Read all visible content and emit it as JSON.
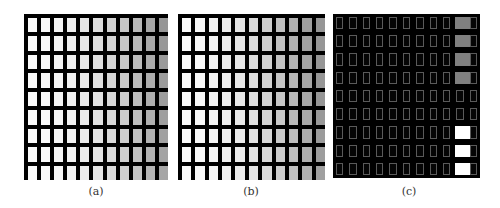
{
  "figure": {
    "panels": [
      {
        "id": "a",
        "label": "(a)",
        "style": "light",
        "x": 24,
        "y": 14,
        "w": 144,
        "h": 166
      },
      {
        "id": "b",
        "label": "(b)",
        "style": "light",
        "x": 178,
        "y": 14,
        "w": 147,
        "h": 166
      },
      {
        "id": "c",
        "label": "(c)",
        "style": "dark",
        "x": 333,
        "y": 14,
        "w": 147,
        "h": 164
      }
    ],
    "grid": {
      "cols": 11,
      "rows": 9
    },
    "highlight_colors": {
      "gray": "#808080",
      "white": "#ffffff"
    },
    "panel_c_highlights": {
      "col": 9,
      "gray_rows": [
        0,
        1,
        2,
        3
      ],
      "white_rows": [
        6,
        7,
        8
      ]
    }
  }
}
